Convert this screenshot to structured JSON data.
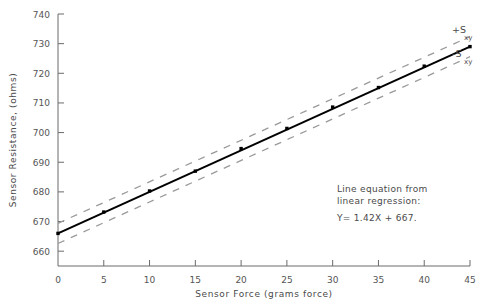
{
  "chart_data": {
    "type": "scatter",
    "title": "",
    "xlabel": "Sensor Force (grams force)",
    "ylabel": "Sensor Resistance, (ohms)",
    "xlim": [
      0,
      45
    ],
    "ylim": [
      655,
      740
    ],
    "xticks": [
      0,
      5,
      10,
      15,
      20,
      25,
      30,
      35,
      40,
      45
    ],
    "yticks": [
      660,
      670,
      680,
      690,
      700,
      710,
      720,
      730,
      740
    ],
    "xtick_labels": [
      "0",
      "5",
      "10",
      "15",
      "20",
      "25",
      "30",
      "35",
      "40",
      "45"
    ],
    "ytick_labels": [
      "660",
      "670",
      "680",
      "690",
      "700",
      "710",
      "720",
      "730",
      "740"
    ],
    "grid": false,
    "legend_position": "right",
    "series": [
      {
        "name": "measured data",
        "style": "points-with-fit-line",
        "x": [
          0,
          5,
          10,
          15,
          20,
          25,
          30,
          35,
          40,
          45
        ],
        "y": [
          666.0,
          673.2,
          680.3,
          687.0,
          694.6,
          701.4,
          708.6,
          715.2,
          722.4,
          729.0
        ]
      },
      {
        "name": "+S_xy",
        "style": "dashed",
        "x": [
          0,
          45
        ],
        "y": [
          669.4,
          732.4
        ]
      },
      {
        "name": "-S_xy",
        "style": "dashed",
        "x": [
          0,
          45
        ],
        "y": [
          662.6,
          725.6
        ]
      }
    ],
    "regression": {
      "slope": 1.42,
      "intercept": 667
    },
    "annotations": [
      {
        "text": "Line equation from"
      },
      {
        "text": "linear regression:"
      },
      {
        "text": "Y= 1.42X + 667."
      }
    ],
    "legend": [
      {
        "sign": "+S",
        "subscript": "xy"
      },
      {
        "sign": "-S",
        "subscript": "xy"
      }
    ],
    "colors": {
      "fit_line": "#000000",
      "band_line": "#9a9a9a",
      "axis": "#6b6b6b",
      "text": "#4a4a4a",
      "background": "#ffffff"
    }
  }
}
